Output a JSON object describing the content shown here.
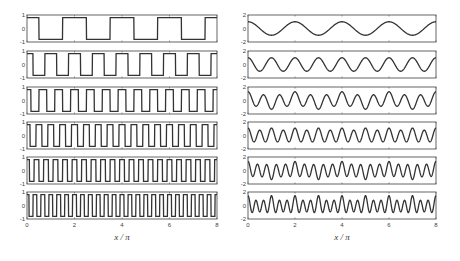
{
  "chart_data": [
    {
      "type": "line",
      "title": "",
      "column": "left",
      "xlabel": "x / π",
      "xlim": [
        0,
        8
      ],
      "xticks": [
        "0",
        "2",
        "4",
        "6",
        "8"
      ],
      "ylim": [
        -1,
        1
      ],
      "yticks": [
        "1",
        "0",
        "-1"
      ],
      "grid": false,
      "legend": null,
      "panels": [
        {
          "name": "square wave, k=1",
          "waveform": "square",
          "cycles_over_range": 4,
          "amplitude": 0.8
        },
        {
          "name": "square wave, k=2",
          "waveform": "square",
          "cycles_over_range": 8,
          "amplitude": 0.8
        },
        {
          "name": "square wave, k=3",
          "waveform": "square",
          "cycles_over_range": 12,
          "amplitude": 0.8
        },
        {
          "name": "square wave, k=4",
          "waveform": "square",
          "cycles_over_range": 16,
          "amplitude": 0.8
        },
        {
          "name": "square wave, k=5",
          "waveform": "square",
          "cycles_over_range": 20,
          "amplitude": 0.8
        },
        {
          "name": "square wave, k=6",
          "waveform": "square",
          "cycles_over_range": 24,
          "amplitude": 0.8
        }
      ]
    },
    {
      "type": "line",
      "title": "",
      "column": "right",
      "xlabel": "x / π",
      "xlim": [
        0,
        8
      ],
      "xticks": [
        "0",
        "2",
        "4",
        "6",
        "8"
      ],
      "ylim": [
        -2,
        2
      ],
      "yticks": [
        "2",
        "0",
        "-2"
      ],
      "grid": false,
      "legend": null,
      "panels": [
        {
          "name": "cosine, k=1",
          "waveform": "cos",
          "cycles_over_range": 4,
          "amplitude": 1.0,
          "harmonics": [
            [
              1,
              1.0
            ]
          ]
        },
        {
          "name": "cosine, k=2",
          "waveform": "cos",
          "cycles_over_range": 8,
          "amplitude": 1.0,
          "harmonics": [
            [
              2,
              1.0
            ]
          ]
        },
        {
          "name": "mixture, k=3",
          "waveform": "sum",
          "cycles_over_range": 12,
          "amplitude": 1.3,
          "harmonics": [
            [
              3,
              1.0
            ],
            [
              1,
              0.3
            ]
          ]
        },
        {
          "name": "mixture, k=4",
          "waveform": "sum",
          "cycles_over_range": 16,
          "amplitude": 1.1,
          "harmonics": [
            [
              4,
              0.95
            ],
            [
              2,
              0.15
            ]
          ]
        },
        {
          "name": "mixture, k=5",
          "waveform": "sum",
          "cycles_over_range": 20,
          "amplitude": 1.3,
          "harmonics": [
            [
              5,
              1.0
            ],
            [
              1,
              0.2
            ],
            [
              3,
              0.15
            ]
          ]
        },
        {
          "name": "mixture, k=6",
          "waveform": "sum",
          "cycles_over_range": 24,
          "amplitude": 1.4,
          "harmonics": [
            [
              6,
              1.0
            ],
            [
              2,
              0.2
            ],
            [
              4,
              0.25
            ]
          ]
        }
      ]
    }
  ],
  "labels": {
    "left_xlabel": "x / π",
    "right_xlabel": "x / π"
  }
}
